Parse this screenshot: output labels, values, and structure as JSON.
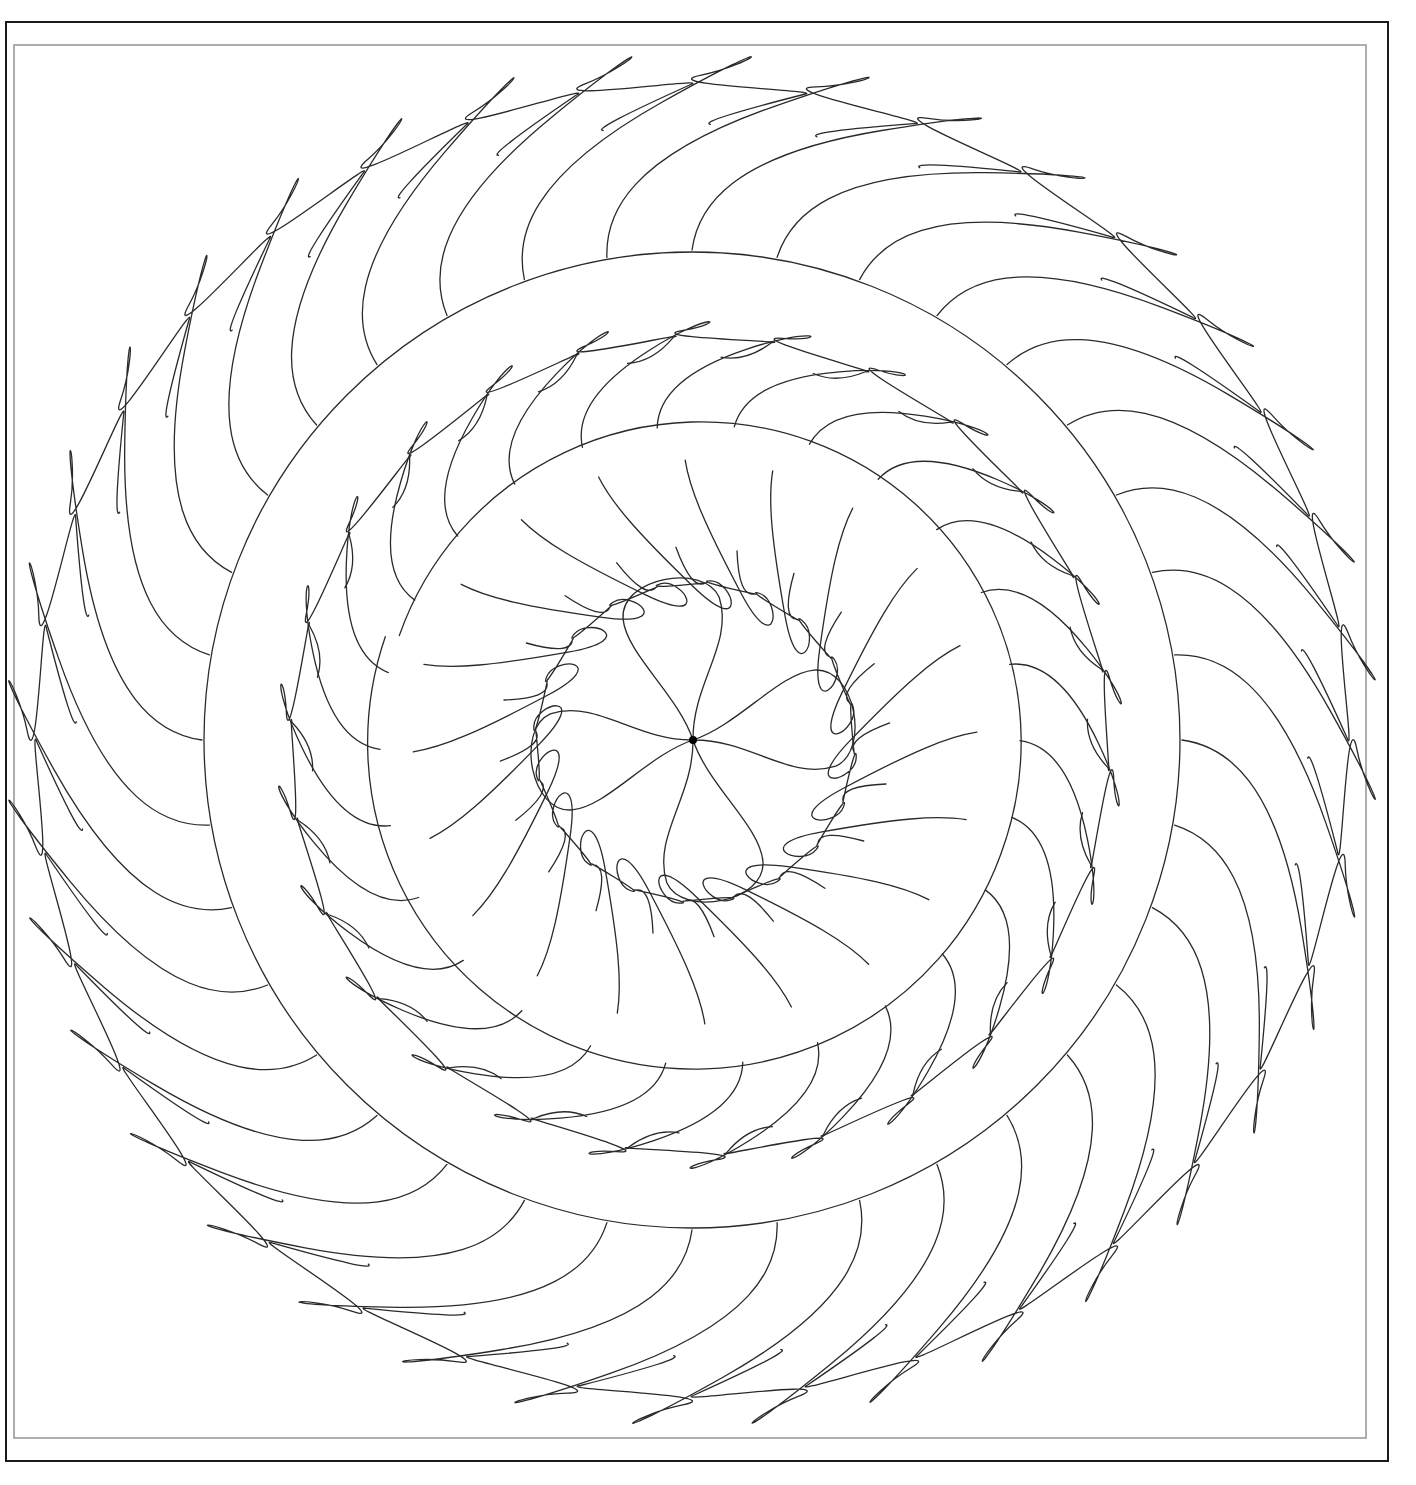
{
  "canvas": {
    "width": 1416,
    "height": 1485,
    "background": "#ffffff"
  },
  "frames": {
    "outer": {
      "x": 6,
      "y": 22,
      "w": 1382,
      "h": 1439,
      "color": "#1a1a1a"
    },
    "inner": {
      "x": 14,
      "y": 45,
      "w": 1352,
      "h": 1393,
      "color": "#9a9a9a"
    }
  },
  "motif": {
    "center": [
      692,
      740
    ],
    "line_color": "#2a2a2a",
    "main_circle_radius": 488,
    "outer_ring": {
      "count": 36,
      "base_radius": 490,
      "tip_radius": 665,
      "sweep_deg": 13
    },
    "middle_ring": {
      "spine": {
        "center": [
          700,
          745
        ],
        "radius": 320
      },
      "count": 26,
      "tip_offset": 95,
      "sweep_deg": 12
    },
    "inner_ring": {
      "spine": {
        "center": [
          695,
          742
        ],
        "radius": 282
      },
      "count": 20,
      "tip_offset": 120,
      "sweep_deg": 16
    },
    "flower": {
      "center": [
        693,
        740
      ],
      "petals": 4,
      "petal_length": 160,
      "petal_width": 92,
      "rotation_deg": -10,
      "dot_radius": 4
    }
  }
}
